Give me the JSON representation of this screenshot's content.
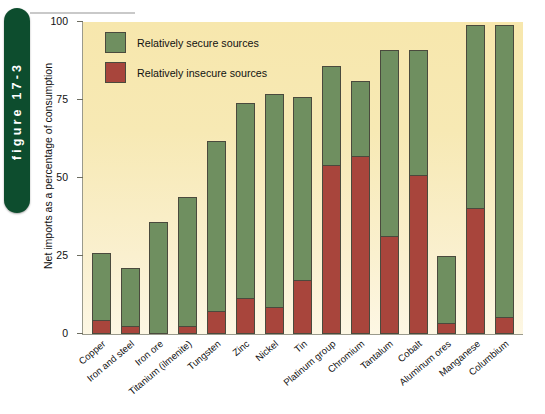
{
  "figure": {
    "tab_label": "figure 17-3"
  },
  "chart_data": {
    "type": "bar",
    "stacked": true,
    "title": "",
    "xlabel": "",
    "ylabel": "Net imports as a percentage of consumption",
    "ylim": [
      0,
      100
    ],
    "yticks": [
      0,
      25,
      50,
      75,
      100
    ],
    "ytick_labels": [
      "0",
      "25",
      "50",
      "75",
      "100"
    ],
    "grid": false,
    "legend_position": "top-left",
    "categories": [
      "Copper",
      "Iron and steel",
      "Iron ore",
      "Titanium (ilmenite)",
      "Tungsten",
      "Zinc",
      "Nickel",
      "Tin",
      "Platinum group",
      "Chromium",
      "Tantalum",
      "Cobalt",
      "Aluminum ores",
      "Manganese",
      "Columbium"
    ],
    "series": [
      {
        "name": "Relatively insecure sources",
        "color": "#a8453c",
        "values": [
          4,
          2,
          0,
          2,
          7,
          11,
          8,
          17,
          54,
          57,
          31,
          51,
          3,
          40,
          5
        ]
      },
      {
        "name": "Relatively secure sources",
        "color": "#6f8f60",
        "values": [
          22,
          19,
          36,
          42,
          55,
          63,
          69,
          59,
          32,
          24,
          60,
          40,
          22,
          59,
          94
        ]
      }
    ],
    "totals": [
      26,
      21,
      36,
      44,
      62,
      74,
      77,
      76,
      86,
      81,
      91,
      91,
      25,
      99,
      99
    ]
  },
  "legend": {
    "items": [
      {
        "label": "Relatively secure sources",
        "color": "#6f8f60"
      },
      {
        "label": "Relatively insecure sources",
        "color": "#a8453c"
      }
    ]
  }
}
